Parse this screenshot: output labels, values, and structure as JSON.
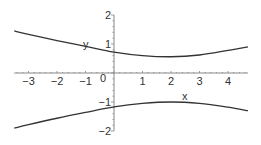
{
  "chart_data": {
    "type": "line",
    "title": "",
    "xlabel": "x",
    "ylabel": "y",
    "xlim": [
      -3.5,
      4.7
    ],
    "ylim": [
      -2,
      2
    ],
    "grid": false,
    "legend": null,
    "x_ticks": [
      -3,
      -2,
      -1,
      0,
      1,
      2,
      3,
      4
    ],
    "x_tick_labels": [
      "−3",
      "−2",
      "−1",
      "0",
      "1",
      "2",
      "3",
      "4"
    ],
    "y_ticks": [
      2,
      1,
      -1,
      -2
    ],
    "y_tick_labels": [
      "2",
      "1",
      "−1",
      "−2"
    ],
    "x": [
      -3.5,
      -3,
      -2,
      -1,
      0,
      1,
      2,
      3,
      4,
      4.7
    ],
    "series": [
      {
        "name": "upper branch",
        "values": [
          1.45,
          1.33,
          1.12,
          0.92,
          0.72,
          0.6,
          0.56,
          0.62,
          0.78,
          0.9
        ]
      },
      {
        "name": "lower branch",
        "values": [
          -1.9,
          -1.78,
          -1.56,
          -1.36,
          -1.17,
          -1.05,
          -1.0,
          -1.05,
          -1.18,
          -1.3
        ]
      }
    ],
    "colors": {
      "curve": "#333333",
      "axis": "#888888",
      "text": "#333333"
    }
  }
}
